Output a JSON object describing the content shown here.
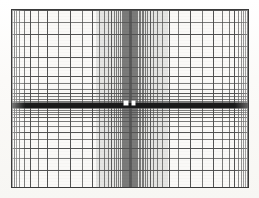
{
  "figure": {
    "kind": "logarithmic-grid-plot",
    "title": "",
    "background_color": "#faf9f7",
    "page_color": "#fdfdfc",
    "grid_line_color": "#4a4a4a",
    "axis_color": "#1a1a1a",
    "frame_color": "#3a3a3a",
    "marker_color": "#ffffff"
  },
  "plot_area": {
    "left": 11,
    "top": 9,
    "width": 238,
    "height": 179,
    "border_px": 1
  },
  "chart_data": {
    "type": "line",
    "title": "",
    "subtitle": "",
    "xlabel": "",
    "ylabel": "",
    "legend": [],
    "grid": true,
    "legend_position": "none",
    "x_center_px": 130,
    "y_center_px": 105,
    "xlim": [
      0,
      238
    ],
    "ylim": [
      0,
      179
    ],
    "x_gridlines_px": [
      12,
      14,
      16,
      19,
      24,
      30,
      38,
      47,
      58,
      70,
      82,
      92,
      99,
      104,
      108,
      111,
      114,
      116,
      118,
      120,
      121.5,
      123,
      124,
      125,
      126,
      127,
      127.8,
      128.6,
      129.3,
      130,
      130.7,
      131.4,
      132.2,
      133,
      134,
      135,
      136,
      137,
      138.5,
      140,
      141.5,
      143,
      145,
      147,
      150,
      153,
      157,
      162,
      169,
      178,
      190,
      202,
      213,
      222,
      229,
      234,
      238,
      241,
      243,
      245,
      247
    ],
    "x_major_gridlines_px": [
      14,
      30,
      47,
      70,
      92,
      111,
      130,
      150,
      169,
      190,
      213,
      234,
      247
    ],
    "y_gridlines_px": [
      10,
      22,
      34,
      46,
      57,
      67,
      76,
      83,
      89,
      93,
      96,
      98.5,
      100.5,
      102,
      103.2,
      104.2,
      105,
      105.8,
      106.8,
      108,
      109.5,
      111.5,
      114,
      117,
      121,
      126,
      132,
      139,
      148,
      158,
      170,
      187
    ],
    "y_major_gridlines_px": [
      10,
      34,
      57,
      76,
      93,
      105,
      117,
      132,
      148,
      170,
      187
    ],
    "axis_band": {
      "y_px": 103,
      "thickness_px": 5,
      "color": "#1a1a1a",
      "note": "heavy horizontal axis rule spanning the full plot width"
    },
    "markers": [
      {
        "label": "",
        "x_px": 124,
        "y_px": 101,
        "w_px": 4,
        "h_px": 4,
        "color": "#ffffff"
      },
      {
        "label": "",
        "x_px": 132,
        "y_px": 101,
        "w_px": 3,
        "h_px": 4,
        "color": "#ffffff"
      }
    ],
    "dense_band": {
      "x_start_px": 96,
      "x_end_px": 168,
      "note": "region where vertical rules merge into a continuous grey tone"
    }
  }
}
